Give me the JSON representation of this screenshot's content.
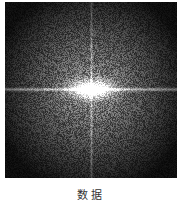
{
  "figure": {
    "type": "fourier-spectrum",
    "caption": "数据",
    "colors": {
      "background": "#111111",
      "center": "#ffffff",
      "noise_mid": "#6a6a6a"
    }
  }
}
